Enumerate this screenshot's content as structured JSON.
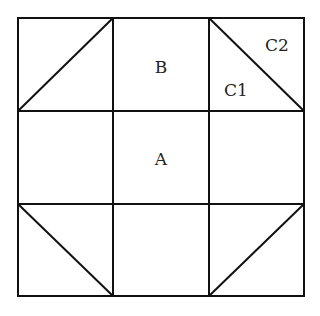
{
  "diagram": {
    "grid": {
      "rows": 3,
      "cols": 3
    },
    "labels": {
      "center": "A",
      "top_middle": "B",
      "top_right_lower": "C1",
      "top_right_upper": "C2"
    },
    "colors": {
      "line": "#111111",
      "background": "#ffffff",
      "text": "#222222"
    }
  }
}
